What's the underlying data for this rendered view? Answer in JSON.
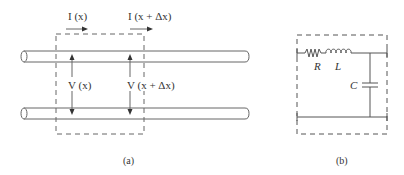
{
  "panel_a": {
    "current_in": "I (x)",
    "current_out": "I (x + Δx)",
    "voltage_in": "V (x)",
    "voltage_out": "V (x + Δx)",
    "caption": "(a)"
  },
  "panel_b": {
    "resistor": "R",
    "inductor": "L",
    "capacitor": "C",
    "caption": "(b)"
  },
  "colors": {
    "stroke": "#555555",
    "text": "#333333"
  }
}
